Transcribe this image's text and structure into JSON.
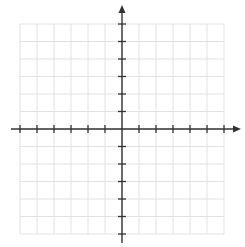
{
  "diagram": {
    "type": "coordinate-plane",
    "grid": {
      "columns": 12,
      "rows": 12,
      "left": 20,
      "top": 24,
      "cell_width": 17,
      "cell_height": 17.5,
      "line_color": "#e2e2e2"
    },
    "axes": {
      "color": "#333333",
      "origin": {
        "x": 122,
        "y": 129
      },
      "x_axis": {
        "start": 11,
        "end": 241,
        "arrow": "right",
        "ticks_left": 6,
        "ticks_right": 6
      },
      "y_axis": {
        "start": 5,
        "end": 243,
        "arrow": "up",
        "ticks_up": 6,
        "ticks_down": 6
      },
      "tick_length": 8
    },
    "labels": []
  }
}
